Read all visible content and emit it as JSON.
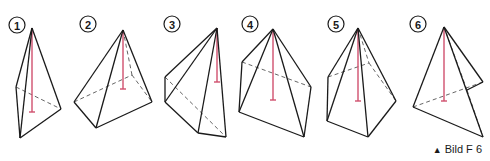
{
  "caption": {
    "marker": "▲",
    "text": "Bild F 6"
  },
  "colors": {
    "edge": "#1a1a1a",
    "height_line": "#d0506e"
  },
  "figures": [
    {
      "label": "1",
      "badge": [
        17,
        25
      ],
      "edges": [
        [
          32,
          28,
          16,
          87
        ],
        [
          32,
          28,
          20,
          138
        ],
        [
          32,
          28,
          61,
          109
        ],
        [
          16,
          87,
          20,
          138
        ],
        [
          20,
          138,
          61,
          109
        ]
      ],
      "hidden": [
        [
          16,
          87,
          61,
          109
        ]
      ],
      "height": [
        32,
        28,
        32,
        112
      ]
    },
    {
      "label": "2",
      "badge": [
        88,
        24
      ],
      "edges": [
        [
          123,
          30,
          74,
          102
        ],
        [
          123,
          30,
          96,
          128
        ],
        [
          123,
          30,
          152,
          102
        ],
        [
          74,
          102,
          96,
          128
        ],
        [
          96,
          128,
          152,
          102
        ]
      ],
      "hidden": [
        [
          74,
          102,
          132,
          75
        ],
        [
          132,
          75,
          152,
          102
        ],
        [
          123,
          30,
          132,
          75
        ]
      ],
      "height": [
        123,
        30,
        123,
        89
      ]
    },
    {
      "label": "3",
      "badge": [
        172,
        24
      ],
      "edges": [
        [
          217,
          28,
          165,
          77
        ],
        [
          217,
          28,
          165,
          102
        ],
        [
          217,
          28,
          198,
          133
        ],
        [
          217,
          28,
          226,
          137
        ],
        [
          165,
          77,
          165,
          102
        ],
        [
          165,
          102,
          198,
          133
        ],
        [
          198,
          133,
          226,
          137
        ]
      ],
      "hidden": [
        [
          165,
          77,
          226,
          137
        ]
      ],
      "height": [
        217,
        28,
        217,
        82
      ]
    },
    {
      "label": "4",
      "badge": [
        250,
        24
      ],
      "edges": [
        [
          273,
          29,
          242,
          62
        ],
        [
          273,
          29,
          239,
          112
        ],
        [
          273,
          29,
          304,
          137
        ],
        [
          273,
          29,
          311,
          87
        ],
        [
          242,
          62,
          239,
          112
        ],
        [
          239,
          112,
          304,
          137
        ],
        [
          304,
          137,
          311,
          87
        ]
      ],
      "hidden": [
        [
          242,
          62,
          311,
          87
        ]
      ],
      "height": [
        273,
        29,
        273,
        100
      ]
    },
    {
      "label": "5",
      "badge": [
        336,
        24
      ],
      "edges": [
        [
          358,
          28,
          328,
          77
        ],
        [
          358,
          28,
          327,
          121
        ],
        [
          358,
          28,
          368,
          137
        ],
        [
          358,
          28,
          396,
          101
        ],
        [
          328,
          77,
          327,
          121
        ],
        [
          327,
          121,
          368,
          137
        ],
        [
          368,
          137,
          396,
          101
        ]
      ],
      "hidden": [
        [
          328,
          77,
          369,
          63
        ],
        [
          369,
          63,
          396,
          101
        ],
        [
          358,
          28,
          369,
          63
        ]
      ],
      "height": [
        358,
        28,
        358,
        101
      ]
    },
    {
      "label": "6",
      "badge": [
        418,
        24
      ],
      "edges": [
        [
          444,
          27,
          413,
          107
        ],
        [
          444,
          27,
          483,
          82
        ],
        [
          444,
          27,
          483,
          137
        ],
        [
          413,
          107,
          483,
          137
        ],
        [
          483,
          82,
          467,
          90
        ]
      ],
      "hidden": [
        [
          413,
          107,
          483,
          82
        ],
        [
          444,
          27,
          467,
          90
        ],
        [
          467,
          90,
          483,
          137
        ]
      ],
      "height": [
        444,
        27,
        444,
        101
      ]
    }
  ]
}
